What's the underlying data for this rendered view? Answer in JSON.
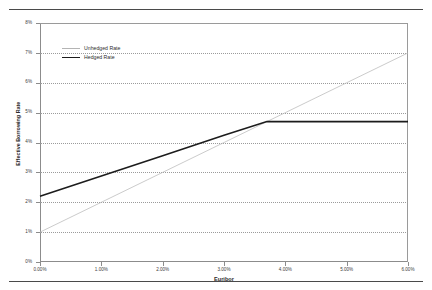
{
  "chart_data": {
    "type": "line",
    "title": "",
    "xlabel": "Euribor",
    "ylabel": "Effective Borrowing Rate",
    "xlim": [
      0,
      6
    ],
    "ylim": [
      0,
      8
    ],
    "grid": true,
    "legend_position": "top-left-inside",
    "x_tick_labels": [
      "0.00%",
      "1.00%",
      "2.00%",
      "3.00%",
      "4.00%",
      "5.00%",
      "6.00%"
    ],
    "x_tick_values": [
      0,
      1,
      2,
      3,
      4,
      5,
      6
    ],
    "y_tick_labels": [
      "0%",
      "1%",
      "2%",
      "3%",
      "4%",
      "5%",
      "6%",
      "7%",
      "8%"
    ],
    "y_tick_values": [
      0,
      1,
      2,
      3,
      4,
      5,
      6,
      7,
      8
    ],
    "series": [
      {
        "name": "Unhedged Rate",
        "color": "#b4b4b4",
        "width": 0.7,
        "x": [
          0,
          1,
          2,
          3,
          4,
          5,
          6
        ],
        "values": [
          1.0,
          2.0,
          3.0,
          4.0,
          5.0,
          6.0,
          7.0
        ]
      },
      {
        "name": "Hedged Rate",
        "color": "#1c1c1c",
        "width": 1.6,
        "x": [
          0,
          1,
          2,
          3,
          3.7,
          4,
          5,
          6
        ],
        "values": [
          2.2,
          2.88,
          3.56,
          4.24,
          4.7,
          4.7,
          4.7,
          4.7
        ]
      }
    ]
  },
  "legend": {
    "items": [
      {
        "label": "Unhedged Rate",
        "color": "#b4b4b4",
        "thickness": "1px"
      },
      {
        "label": "Hedged Rate",
        "color": "#1c1c1c",
        "thickness": "1.8px"
      }
    ]
  },
  "axes": {
    "x_title": "Euribor",
    "y_title": "Effective Borrowing Rate"
  },
  "y_labels": [
    {
      "text": "8%",
      "value": 8
    },
    {
      "text": "7%",
      "value": 7
    },
    {
      "text": "6%",
      "value": 6
    },
    {
      "text": "5%",
      "value": 5
    },
    {
      "text": "4%",
      "value": 4
    },
    {
      "text": "3%",
      "value": 3
    },
    {
      "text": "2%",
      "value": 2
    },
    {
      "text": "1%",
      "value": 1
    },
    {
      "text": "0%",
      "value": 0
    }
  ],
  "x_labels": [
    {
      "text": "0.00%",
      "value": 0
    },
    {
      "text": "1.00%",
      "value": 1
    },
    {
      "text": "2.00%",
      "value": 2
    },
    {
      "text": "3.00%",
      "value": 3
    },
    {
      "text": "4.00%",
      "value": 4
    },
    {
      "text": "5.00%",
      "value": 5
    },
    {
      "text": "6.00%",
      "value": 6
    }
  ],
  "colors": {
    "unhedged": "#b4b4b4",
    "hedged": "#1c1c1c",
    "grid": "#9b9b9b",
    "axis": "#8c8c8c",
    "frame": "#4a4a4a",
    "background": "#ffffff"
  }
}
